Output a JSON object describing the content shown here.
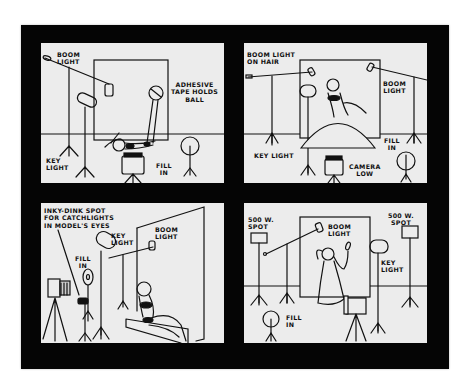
{
  "figure": {
    "colors": {
      "frame": "#050505",
      "panel_bg": "#ececec",
      "ink": "#111111",
      "page_bg": "#ffffff"
    }
  },
  "panels": [
    {
      "position": "top-left",
      "labels": {
        "boom_light": "BOOM\nLIGHT",
        "adhesive": "ADHESIVE\nTAPE HOLDS\nBALL",
        "key_light": "KEY\nLIGHT",
        "fill_in": "FILL\nIN"
      }
    },
    {
      "position": "top-right",
      "labels": {
        "boom_hair": "BOOM LIGHT\nON HAIR",
        "boom_light": "BOOM\nLIGHT",
        "fill_in": "FILL\nIN",
        "key_light": "KEY LIGHT",
        "camera_low": "CAMERA\nLOW"
      }
    },
    {
      "position": "bottom-left",
      "labels": {
        "inky_dink": "INKY-DINK SPOT\nFOR CATCHLIGHTS\nIN MODEL'S EYES",
        "key_light": "KEY\nLIGHT",
        "boom_light": "BOOM\nLIGHT",
        "fill_in": "FILL\nIN"
      }
    },
    {
      "position": "bottom-right",
      "labels": {
        "spot_left": "500 W.\nSPOT",
        "boom_light": "BOOM\nLIGHT",
        "spot_right": "500 W.\nSPOT",
        "key_light": "KEY\nLIGHT",
        "fill_in": "FILL\nIN"
      }
    }
  ]
}
